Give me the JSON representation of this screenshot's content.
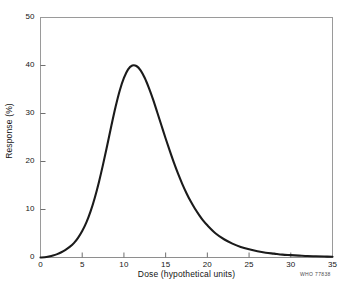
{
  "figure": {
    "background_color": "#ffffff",
    "credit_text": "WHO 77838"
  },
  "chart_data": {
    "type": "line",
    "title": "",
    "subtitle": "",
    "xlabel": "Dose (hypothetical units)",
    "ylabel": "Response (%)",
    "xlim": [
      0,
      35
    ],
    "ylim": [
      0,
      50
    ],
    "xticks": [
      0,
      5,
      10,
      15,
      20,
      25,
      30,
      35
    ],
    "yticks": [
      0,
      10,
      20,
      30,
      40,
      50
    ],
    "xtick_labels": [
      "0",
      "5",
      "10",
      "15",
      "20",
      "25",
      "30",
      "35"
    ],
    "ytick_labels": [
      "0",
      "10",
      "20",
      "30",
      "40",
      "50"
    ],
    "grid": false,
    "legend": null,
    "legend_position": "none",
    "line_color": "#1b1b1b",
    "line_width": 2.1,
    "annotations": [],
    "series": [
      {
        "name": "Dose-response",
        "x": [
          0,
          0.5,
          1,
          1.5,
          2,
          2.5,
          3,
          3.5,
          4,
          4.5,
          5,
          5.5,
          6,
          6.5,
          7,
          7.5,
          8,
          8.5,
          9,
          9.5,
          10,
          10.5,
          11,
          11.5,
          12,
          12.5,
          13,
          13.5,
          14,
          14.5,
          15,
          15.5,
          16,
          16.5,
          17,
          17.5,
          18,
          18.5,
          19,
          19.5,
          20,
          21,
          22,
          23,
          24,
          25,
          26,
          27,
          28,
          29,
          30,
          31,
          32,
          33,
          34,
          35
        ],
        "values": [
          0,
          0.05,
          0.2,
          0.4,
          0.7,
          1.1,
          1.6,
          2.2,
          3.0,
          4.1,
          5.5,
          7.3,
          9.6,
          12.4,
          15.7,
          19.4,
          23.4,
          27.5,
          31.4,
          34.8,
          37.4,
          39.2,
          40.0,
          39.9,
          39.0,
          37.4,
          35.3,
          32.9,
          30.2,
          27.5,
          24.8,
          22.2,
          19.7,
          17.4,
          15.3,
          13.4,
          11.7,
          10.2,
          8.9,
          7.7,
          6.7,
          5.0,
          3.8,
          2.9,
          2.2,
          1.7,
          1.3,
          1.0,
          0.8,
          0.6,
          0.5,
          0.4,
          0.3,
          0.25,
          0.2,
          0.15
        ]
      }
    ],
    "peak": {
      "x": 11,
      "y": 40
    }
  }
}
